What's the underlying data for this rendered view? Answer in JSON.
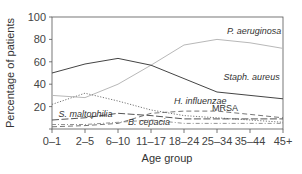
{
  "chart_data": {
    "type": "line",
    "title": "",
    "xlabel": "Age group",
    "ylabel": "Percentage of patients",
    "ylim": [
      0,
      100
    ],
    "yticks": [
      20,
      40,
      60,
      80,
      100
    ],
    "grid": false,
    "legend": "inline labels",
    "categories": [
      "0–1",
      "2–5",
      "6–10",
      "11–17",
      "18–24",
      "25–34",
      "35–44",
      "45+"
    ],
    "series": [
      {
        "name": "P. aeruginosa",
        "style": "solid-light",
        "color": "#b8b8b8",
        "values": [
          30,
          28,
          40,
          57,
          75,
          80,
          77,
          72
        ]
      },
      {
        "name": "Staph. aureus",
        "style": "solid-dark",
        "color": "#444444",
        "values": [
          50,
          58,
          63,
          57,
          45,
          33,
          30,
          27
        ]
      },
      {
        "name": "H. influenzae",
        "style": "dotted",
        "color": "#777777",
        "values": [
          22,
          32,
          25,
          17,
          12,
          10,
          8,
          6
        ]
      },
      {
        "name": "MRSA",
        "style": "dashed",
        "color": "#666666",
        "values": [
          2,
          3,
          5,
          14,
          16,
          16,
          13,
          10
        ]
      },
      {
        "name": "S. maltophilia",
        "style": "long-dash",
        "color": "#555555",
        "values": [
          8,
          10,
          14,
          12,
          9,
          9,
          9,
          9
        ]
      },
      {
        "name": "B. cepacia",
        "style": "dash-dot",
        "color": "#888888",
        "values": [
          4,
          4,
          6,
          8,
          5,
          5,
          5,
          5
        ]
      }
    ],
    "annotations": [
      {
        "text": "P. aeruginosa",
        "x_index": 5.3,
        "y": 85,
        "italic": true
      },
      {
        "text": "Staph. aureus",
        "x_index": 5.2,
        "y": 44,
        "italic": true
      },
      {
        "text": "H. influenzae",
        "x_index": 3.7,
        "y": 22,
        "italic": true
      },
      {
        "text": "MRSA",
        "x_index": 4.85,
        "y": 16,
        "italic": false
      },
      {
        "text": "S. maltophilia",
        "x_index": 0.2,
        "y": 11,
        "italic": true
      },
      {
        "text": "B. cepacia",
        "x_index": 2.3,
        "y": 3.5,
        "italic": true
      }
    ]
  }
}
